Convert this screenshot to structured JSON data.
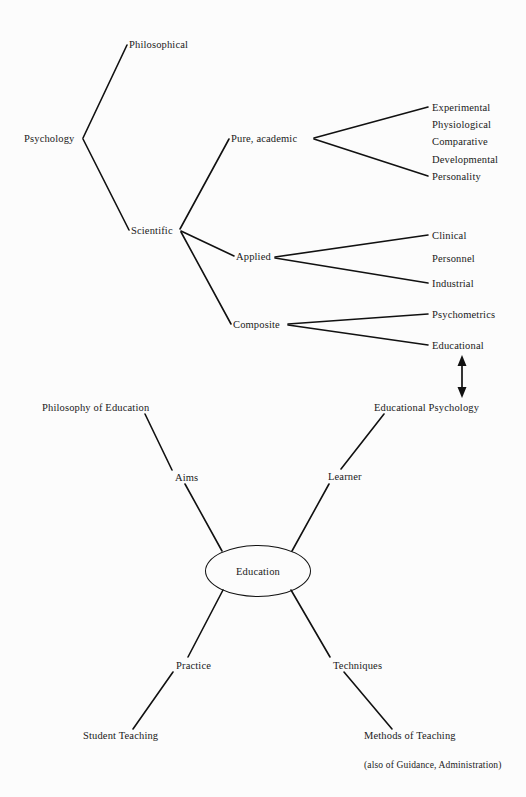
{
  "diagram": {
    "background_color": "#fcfcfc",
    "line_color": "#111111",
    "text_color": "#1a1a1a",
    "upper_tree": {
      "root": {
        "label": "Psychology",
        "x": 24,
        "y": 138
      },
      "level1": [
        {
          "label": "Philosophical",
          "x": 129,
          "y": 44
        },
        {
          "label": "Scientific",
          "x": 131,
          "y": 230
        }
      ],
      "level2": [
        {
          "label": "Pure, academic",
          "x": 231,
          "y": 138
        },
        {
          "label": "Applied",
          "x": 236,
          "y": 256
        },
        {
          "label": "Composite",
          "x": 233,
          "y": 324
        }
      ],
      "pure_academic_children": [
        {
          "label": "Experimental",
          "x": 432,
          "y": 107
        },
        {
          "label": "Physiological",
          "x": 432,
          "y": 124
        },
        {
          "label": "Comparative",
          "x": 432,
          "y": 141
        },
        {
          "label": "Developmental",
          "x": 432,
          "y": 159
        },
        {
          "label": "Personality",
          "x": 432,
          "y": 176
        }
      ],
      "applied_children": [
        {
          "label": "Clinical",
          "x": 432,
          "y": 235
        },
        {
          "label": "Personnel",
          "x": 432,
          "y": 258
        },
        {
          "label": "Industrial",
          "x": 432,
          "y": 283
        }
      ],
      "composite_children": [
        {
          "label": "Psychometrics",
          "x": 432,
          "y": 314
        },
        {
          "label": "Educational",
          "x": 432,
          "y": 345
        }
      ]
    },
    "link_arrow": {
      "name": "double-headed-arrow",
      "from_label": "Educational",
      "to_label": "Educational Psychology",
      "x": 462,
      "y_top": 357,
      "y_bottom": 396
    },
    "lower_star": {
      "center": {
        "label": "Education",
        "cx": 257,
        "cy": 570,
        "rx": 52,
        "ry": 25
      },
      "inner": [
        {
          "label": "Aims",
          "x": 175,
          "y": 477
        },
        {
          "label": "Learner",
          "x": 328,
          "y": 476
        },
        {
          "label": "Practice",
          "x": 176,
          "y": 665
        },
        {
          "label": "Techniques",
          "x": 333,
          "y": 665
        }
      ],
      "outer": [
        {
          "label": "Philosophy of Education",
          "x": 42,
          "y": 407
        },
        {
          "label": "Educational Psychology",
          "x": 374,
          "y": 407
        },
        {
          "label": "Student Teaching",
          "x": 83,
          "y": 735
        },
        {
          "label": "Methods of Teaching",
          "x": 364,
          "y": 735
        }
      ],
      "footnote": {
        "label": "(also of Guidance, Administration)",
        "x": 364,
        "y": 765
      }
    }
  }
}
